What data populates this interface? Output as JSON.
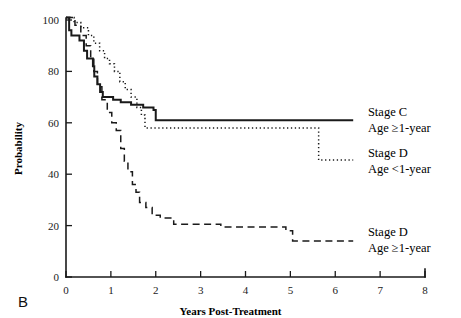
{
  "panel_label": "B",
  "chart_data": {
    "type": "line",
    "title": "",
    "xlabel": "Years Post-Treatment",
    "ylabel": "Probability",
    "xlim": [
      0,
      8
    ],
    "ylim": [
      0,
      100
    ],
    "xticks": [
      "0",
      "1",
      "2",
      "3",
      "4",
      "5",
      "6",
      "7",
      "8"
    ],
    "yticks": [
      "0",
      "20",
      "40",
      "60",
      "80",
      "100"
    ],
    "grid": false,
    "legend_position": "right-inline",
    "colors": {
      "line": "#1a1a1a",
      "background": "#ffffff"
    },
    "series": [
      {
        "name": "Stage C Age >=1-year",
        "label_line1": "Stage C",
        "label_line2": "Age ≥1-year",
        "style": "solid",
        "label_x": 6.55,
        "label_y": 62.5,
        "points": [
          [
            0.0,
            101
          ],
          [
            0.07,
            101
          ],
          [
            0.07,
            96
          ],
          [
            0.12,
            96
          ],
          [
            0.12,
            94
          ],
          [
            0.3,
            94
          ],
          [
            0.3,
            92
          ],
          [
            0.4,
            92
          ],
          [
            0.4,
            88
          ],
          [
            0.47,
            88
          ],
          [
            0.47,
            85
          ],
          [
            0.6,
            85
          ],
          [
            0.6,
            82
          ],
          [
            0.63,
            82
          ],
          [
            0.63,
            78
          ],
          [
            0.7,
            78
          ],
          [
            0.7,
            75
          ],
          [
            0.76,
            75
          ],
          [
            0.76,
            72
          ],
          [
            0.82,
            72
          ],
          [
            0.82,
            70
          ],
          [
            1.05,
            70
          ],
          [
            1.05,
            69
          ],
          [
            1.22,
            69
          ],
          [
            1.22,
            68
          ],
          [
            1.45,
            68
          ],
          [
            1.45,
            67
          ],
          [
            1.72,
            67
          ],
          [
            1.72,
            66
          ],
          [
            1.95,
            66
          ],
          [
            1.95,
            65
          ],
          [
            2.0,
            65
          ],
          [
            2.0,
            61
          ],
          [
            6.4,
            61
          ]
        ]
      },
      {
        "name": "Stage D Age <1-year",
        "label_line1": "Stage D",
        "label_line2": "Age <1-year",
        "style": "dotted",
        "label_x": 6.55,
        "label_y": 46.5,
        "points": [
          [
            0.0,
            101
          ],
          [
            0.18,
            101
          ],
          [
            0.18,
            99
          ],
          [
            0.33,
            99
          ],
          [
            0.33,
            97
          ],
          [
            0.5,
            97
          ],
          [
            0.5,
            94
          ],
          [
            0.62,
            94
          ],
          [
            0.62,
            91
          ],
          [
            0.75,
            91
          ],
          [
            0.75,
            88
          ],
          [
            0.86,
            88
          ],
          [
            0.86,
            85
          ],
          [
            0.97,
            85
          ],
          [
            0.97,
            83
          ],
          [
            1.08,
            83
          ],
          [
            1.08,
            80
          ],
          [
            1.2,
            80
          ],
          [
            1.2,
            76
          ],
          [
            1.32,
            76
          ],
          [
            1.32,
            73
          ],
          [
            1.45,
            73
          ],
          [
            1.45,
            70
          ],
          [
            1.58,
            70
          ],
          [
            1.58,
            66
          ],
          [
            1.68,
            66
          ],
          [
            1.68,
            63
          ],
          [
            1.76,
            63
          ],
          [
            1.76,
            58
          ],
          [
            5.63,
            58
          ],
          [
            5.63,
            45.5
          ],
          [
            6.4,
            45.5
          ]
        ]
      },
      {
        "name": "Stage D Age >=1-year",
        "label_line1": "Stage D",
        "label_line2": "Age ≥1-year",
        "style": "dashed",
        "label_x": 6.55,
        "label_y": 16.0,
        "points": [
          [
            0.0,
            101
          ],
          [
            0.2,
            101
          ],
          [
            0.2,
            98
          ],
          [
            0.33,
            98
          ],
          [
            0.33,
            94
          ],
          [
            0.45,
            94
          ],
          [
            0.45,
            90
          ],
          [
            0.55,
            90
          ],
          [
            0.55,
            85
          ],
          [
            0.62,
            85
          ],
          [
            0.62,
            80
          ],
          [
            0.7,
            80
          ],
          [
            0.7,
            74
          ],
          [
            0.8,
            74
          ],
          [
            0.8,
            69
          ],
          [
            0.92,
            69
          ],
          [
            0.92,
            64
          ],
          [
            1.02,
            64
          ],
          [
            1.02,
            60
          ],
          [
            1.12,
            60
          ],
          [
            1.12,
            57
          ],
          [
            1.22,
            57
          ],
          [
            1.22,
            50
          ],
          [
            1.3,
            50
          ],
          [
            1.3,
            45
          ],
          [
            1.38,
            45
          ],
          [
            1.38,
            41
          ],
          [
            1.48,
            41
          ],
          [
            1.48,
            36
          ],
          [
            1.56,
            36
          ],
          [
            1.56,
            33
          ],
          [
            1.64,
            33
          ],
          [
            1.64,
            29
          ],
          [
            1.78,
            29
          ],
          [
            1.78,
            27
          ],
          [
            1.92,
            27
          ],
          [
            1.92,
            24
          ],
          [
            2.1,
            24
          ],
          [
            2.1,
            23
          ],
          [
            2.4,
            23
          ],
          [
            2.4,
            20.5
          ],
          [
            3.45,
            20.5
          ],
          [
            3.45,
            19.5
          ],
          [
            4.9,
            19.5
          ],
          [
            4.9,
            18
          ],
          [
            5.05,
            18
          ],
          [
            5.05,
            14
          ],
          [
            6.4,
            14
          ]
        ]
      }
    ]
  }
}
